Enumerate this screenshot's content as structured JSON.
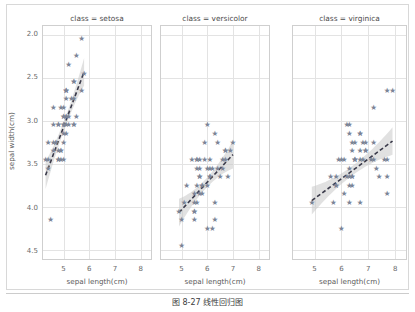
{
  "figure": {
    "caption": "图 8-27  线性回归图",
    "marker_color": "#7b8496",
    "line_color": "#3a3a4a",
    "band_color": "#c9c9c9",
    "grid_color": "#e3e3e3"
  },
  "axes": {
    "ylabel": "sepal width(cm)",
    "xlabel": "sepal length(cm)",
    "yticks": [
      "4.5",
      "4.0",
      "3.5",
      "3.0",
      "2.5",
      "2.0"
    ],
    "xticks": [
      "5",
      "6",
      "7",
      "8"
    ]
  },
  "panels": [
    {
      "title": "class = setosa"
    },
    {
      "title": "class = versicolor"
    },
    {
      "title": "class = virginica"
    }
  ],
  "chart_data": {
    "type": "scatter",
    "title": "图 8-27  线性回归图",
    "xlabel": "sepal length(cm)",
    "ylabel": "sepal width(cm)",
    "xlim": [
      4.2,
      8.4
    ],
    "ylim": [
      1.9,
      4.6
    ],
    "xticks": [
      5,
      6,
      7,
      8
    ],
    "yticks": [
      2.0,
      2.5,
      3.0,
      3.5,
      4.0,
      4.5
    ],
    "grid": true,
    "legend": "none",
    "marker": "star",
    "facet_variable": "class",
    "regression": "linear with 95% confidence band, dashed line",
    "facets": [
      {
        "label": "class = setosa",
        "fit": {
          "slope": 0.8,
          "intercept": -0.57,
          "x_range": [
            4.3,
            5.8
          ]
        },
        "points": [
          [
            5.1,
            3.5
          ],
          [
            4.9,
            3.0
          ],
          [
            4.7,
            3.2
          ],
          [
            4.6,
            3.1
          ],
          [
            5.0,
            3.6
          ],
          [
            5.4,
            3.9
          ],
          [
            4.6,
            3.4
          ],
          [
            5.0,
            3.4
          ],
          [
            4.4,
            2.9
          ],
          [
            4.9,
            3.1
          ],
          [
            5.4,
            3.7
          ],
          [
            4.8,
            3.4
          ],
          [
            4.8,
            3.0
          ],
          [
            4.3,
            3.0
          ],
          [
            5.8,
            4.0
          ],
          [
            5.7,
            4.4
          ],
          [
            5.4,
            3.9
          ],
          [
            5.1,
            3.5
          ],
          [
            5.7,
            3.8
          ],
          [
            5.1,
            3.8
          ],
          [
            5.4,
            3.4
          ],
          [
            5.1,
            3.7
          ],
          [
            4.6,
            3.6
          ],
          [
            5.1,
            3.3
          ],
          [
            4.8,
            3.4
          ],
          [
            5.0,
            3.0
          ],
          [
            5.0,
            3.4
          ],
          [
            5.2,
            3.5
          ],
          [
            5.2,
            3.4
          ],
          [
            4.7,
            3.2
          ],
          [
            4.8,
            3.1
          ],
          [
            5.4,
            3.4
          ],
          [
            5.2,
            4.1
          ],
          [
            5.5,
            4.2
          ],
          [
            4.9,
            3.1
          ],
          [
            5.0,
            3.2
          ],
          [
            5.5,
            3.5
          ],
          [
            4.9,
            3.6
          ],
          [
            4.4,
            3.0
          ],
          [
            5.1,
            3.4
          ],
          [
            5.0,
            3.5
          ],
          [
            4.5,
            2.3
          ],
          [
            4.4,
            3.2
          ],
          [
            5.0,
            3.5
          ],
          [
            5.1,
            3.8
          ],
          [
            4.8,
            3.0
          ],
          [
            5.1,
            3.8
          ],
          [
            4.6,
            3.2
          ],
          [
            5.3,
            3.7
          ],
          [
            5.0,
            3.3
          ]
        ]
      },
      {
        "label": "class = versicolor",
        "fit": {
          "slope": 0.32,
          "intercept": 0.87,
          "x_range": [
            4.9,
            7.0
          ]
        },
        "points": [
          [
            7.0,
            3.2
          ],
          [
            6.4,
            3.2
          ],
          [
            6.9,
            3.1
          ],
          [
            5.5,
            2.3
          ],
          [
            6.5,
            2.8
          ],
          [
            5.7,
            2.8
          ],
          [
            6.3,
            3.3
          ],
          [
            4.9,
            2.4
          ],
          [
            6.6,
            2.9
          ],
          [
            5.2,
            2.7
          ],
          [
            5.0,
            2.0
          ],
          [
            5.9,
            3.0
          ],
          [
            6.0,
            2.2
          ],
          [
            6.1,
            2.9
          ],
          [
            5.6,
            2.9
          ],
          [
            6.7,
            3.1
          ],
          [
            5.6,
            3.0
          ],
          [
            5.8,
            2.7
          ],
          [
            6.2,
            2.2
          ],
          [
            5.6,
            2.5
          ],
          [
            5.9,
            3.2
          ],
          [
            6.1,
            2.8
          ],
          [
            6.3,
            2.5
          ],
          [
            6.1,
            2.8
          ],
          [
            6.4,
            2.9
          ],
          [
            6.6,
            3.0
          ],
          [
            6.8,
            2.8
          ],
          [
            6.7,
            3.0
          ],
          [
            6.0,
            2.9
          ],
          [
            5.7,
            2.6
          ],
          [
            5.5,
            2.4
          ],
          [
            5.5,
            2.4
          ],
          [
            5.8,
            2.7
          ],
          [
            6.0,
            2.7
          ],
          [
            5.4,
            3.0
          ],
          [
            6.0,
            3.4
          ],
          [
            6.7,
            3.1
          ],
          [
            6.3,
            2.3
          ],
          [
            5.6,
            3.0
          ],
          [
            5.5,
            2.5
          ],
          [
            5.5,
            2.6
          ],
          [
            6.1,
            3.0
          ],
          [
            5.8,
            2.6
          ],
          [
            5.0,
            2.3
          ],
          [
            5.6,
            2.7
          ],
          [
            5.7,
            3.0
          ],
          [
            5.7,
            2.9
          ],
          [
            6.2,
            2.9
          ],
          [
            5.1,
            2.5
          ],
          [
            5.7,
            2.8
          ]
        ]
      },
      {
        "label": "class = virginica",
        "fit": {
          "slope": 0.23,
          "intercept": 1.45,
          "x_range": [
            4.9,
            7.9
          ]
        },
        "points": [
          [
            6.3,
            3.3
          ],
          [
            5.8,
            2.7
          ],
          [
            7.1,
            3.0
          ],
          [
            6.3,
            2.9
          ],
          [
            6.5,
            3.0
          ],
          [
            7.6,
            3.0
          ],
          [
            4.9,
            2.5
          ],
          [
            7.3,
            2.9
          ],
          [
            6.7,
            2.5
          ],
          [
            7.2,
            3.6
          ],
          [
            6.5,
            3.2
          ],
          [
            6.4,
            2.7
          ],
          [
            6.8,
            3.0
          ],
          [
            5.7,
            2.5
          ],
          [
            5.8,
            2.8
          ],
          [
            6.4,
            3.2
          ],
          [
            6.5,
            3.0
          ],
          [
            7.7,
            3.8
          ],
          [
            7.7,
            2.6
          ],
          [
            6.0,
            2.2
          ],
          [
            6.9,
            3.2
          ],
          [
            5.6,
            2.8
          ],
          [
            7.7,
            2.8
          ],
          [
            6.3,
            2.7
          ],
          [
            6.7,
            3.3
          ],
          [
            7.2,
            3.2
          ],
          [
            6.2,
            2.8
          ],
          [
            6.1,
            3.0
          ],
          [
            6.4,
            2.8
          ],
          [
            7.2,
            3.0
          ],
          [
            7.4,
            2.8
          ],
          [
            7.9,
            3.8
          ],
          [
            6.4,
            2.8
          ],
          [
            6.3,
            2.8
          ],
          [
            6.1,
            2.6
          ],
          [
            7.7,
            3.0
          ],
          [
            6.3,
            3.4
          ],
          [
            6.4,
            3.1
          ],
          [
            6.0,
            3.0
          ],
          [
            6.9,
            3.1
          ],
          [
            6.7,
            3.1
          ],
          [
            6.9,
            3.1
          ],
          [
            5.8,
            2.7
          ],
          [
            6.8,
            3.2
          ],
          [
            6.7,
            3.3
          ],
          [
            6.7,
            3.0
          ],
          [
            6.3,
            2.5
          ],
          [
            6.5,
            3.0
          ],
          [
            6.2,
            3.4
          ],
          [
            5.9,
            3.0
          ]
        ]
      }
    ]
  }
}
